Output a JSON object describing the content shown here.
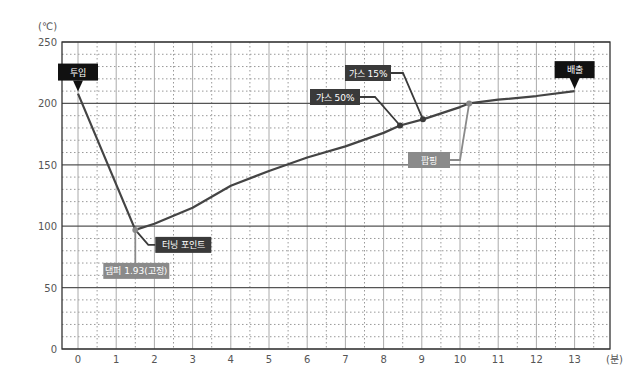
{
  "chart_data": {
    "type": "line",
    "title": "",
    "xlabel": "(분)",
    "ylabel": "(℃)",
    "xlim": [
      0,
      14
    ],
    "ylim": [
      0,
      250
    ],
    "x_ticks": [
      0,
      1,
      2,
      3,
      4,
      5,
      6,
      7,
      8,
      9,
      10,
      11,
      12,
      13
    ],
    "y_ticks": [
      0,
      50,
      100,
      150,
      200,
      250
    ],
    "grid": true,
    "series": [
      {
        "name": "로스팅 온도",
        "color": "#444444",
        "points": [
          [
            0,
            208
          ],
          [
            1.5,
            97
          ],
          [
            2,
            102
          ],
          [
            3,
            115
          ],
          [
            4,
            133
          ],
          [
            5,
            145
          ],
          [
            6,
            156
          ],
          [
            7,
            165
          ],
          [
            8,
            176
          ],
          [
            8.43,
            182
          ],
          [
            9.03,
            187
          ],
          [
            10,
            197
          ],
          [
            10.24,
            200
          ],
          [
            11,
            203
          ],
          [
            12,
            206
          ],
          [
            13,
            210
          ]
        ]
      }
    ],
    "annotations": [
      {
        "id": "start",
        "label": "투입",
        "x": 0,
        "y": 208,
        "style": "black-callout"
      },
      {
        "id": "turning",
        "label": "터닝 포인트",
        "x": 1.5,
        "y": 97,
        "style": "dark-box"
      },
      {
        "id": "damper",
        "label": "댐퍼 1.93(고정)",
        "x": 1.5,
        "y": 97,
        "style": "gray-box"
      },
      {
        "id": "gas50",
        "label": "가스 50%",
        "x": 8.43,
        "y": 182,
        "style": "dark-box"
      },
      {
        "id": "gas15",
        "label": "가스 15%",
        "x": 9.03,
        "y": 187,
        "style": "dark-box"
      },
      {
        "id": "popping",
        "label": "팝핑",
        "x": 10.24,
        "y": 200,
        "style": "gray-box"
      },
      {
        "id": "end",
        "label": "배출",
        "x": 13,
        "y": 210,
        "style": "black-callout"
      }
    ]
  },
  "colors": {
    "line": "#444444",
    "dark_label": "#3a3a3a",
    "gray_label": "#8a8a8a",
    "black_callout": "#111111",
    "grid_major": "#555555",
    "grid_minor": "#999999"
  }
}
